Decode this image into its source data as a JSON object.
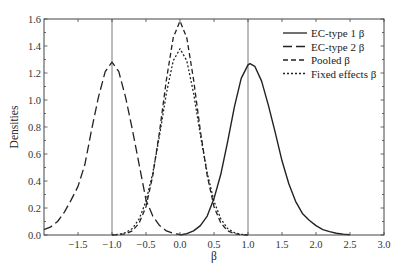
{
  "chart_data": {
    "type": "line",
    "title": "",
    "xlabel": "β",
    "ylabel": "Densities",
    "xlim": [
      -2.0,
      3.0
    ],
    "ylim": [
      0.0,
      1.6
    ],
    "grid": false,
    "legend_position": "upper right",
    "xticks": [
      -1.5,
      -1.0,
      -0.5,
      0.0,
      0.5,
      1.0,
      1.5,
      2.0,
      2.5,
      3.0
    ],
    "xtick_labels": [
      "−1.5",
      "−1.0",
      "−0.5",
      "0.0",
      "0.5",
      "1.0",
      "1.5",
      "2.0",
      "2.5",
      "3.0"
    ],
    "yticks": [
      0.0,
      0.2,
      0.4,
      0.6,
      0.8,
      1.0,
      1.2,
      1.4,
      1.6
    ],
    "ytick_labels": [
      "0.0",
      "0.2",
      "0.4",
      "0.6",
      "0.8",
      "1.0",
      "1.2",
      "1.4",
      "1.6"
    ],
    "vertical_lines": [
      -1.0,
      1.0
    ],
    "series": [
      {
        "name": "EC-type 1 β",
        "style": "solid",
        "x": [
          0.0,
          0.1,
          0.2,
          0.3,
          0.4,
          0.5,
          0.6,
          0.7,
          0.8,
          0.9,
          1.0,
          1.03,
          1.1,
          1.2,
          1.3,
          1.4,
          1.5,
          1.6,
          1.7,
          1.8,
          1.9,
          2.0,
          2.1,
          2.2,
          2.3,
          2.4,
          2.5
        ],
        "y": [
          0.0,
          0.01,
          0.03,
          0.07,
          0.14,
          0.27,
          0.45,
          0.69,
          0.95,
          1.16,
          1.26,
          1.27,
          1.25,
          1.14,
          0.96,
          0.76,
          0.55,
          0.38,
          0.25,
          0.16,
          0.11,
          0.07,
          0.04,
          0.025,
          0.013,
          0.006,
          0.002
        ]
      },
      {
        "name": "EC-type 2 β",
        "style": "long-dash",
        "x": [
          -2.0,
          -1.9,
          -1.8,
          -1.7,
          -1.6,
          -1.5,
          -1.4,
          -1.3,
          -1.2,
          -1.1,
          -1.0,
          -0.9,
          -0.8,
          -0.7,
          -0.6,
          -0.5,
          -0.4,
          -0.3,
          -0.2,
          -0.1,
          0.0
        ],
        "y": [
          0.04,
          0.06,
          0.1,
          0.17,
          0.26,
          0.36,
          0.52,
          0.78,
          1.02,
          1.21,
          1.28,
          1.21,
          1.02,
          0.78,
          0.52,
          0.26,
          0.14,
          0.07,
          0.03,
          0.012,
          0.004
        ]
      },
      {
        "name": "Pooled β",
        "style": "dashed",
        "x": [
          -1.0,
          -0.9,
          -0.8,
          -0.7,
          -0.6,
          -0.5,
          -0.4,
          -0.3,
          -0.2,
          -0.1,
          0.0,
          0.1,
          0.2,
          0.3,
          0.4,
          0.5,
          0.6,
          0.7,
          0.8,
          0.9,
          1.0
        ],
        "y": [
          0.0,
          0.002,
          0.009,
          0.031,
          0.089,
          0.21,
          0.44,
          0.77,
          1.15,
          1.46,
          1.585,
          1.46,
          1.15,
          0.77,
          0.44,
          0.21,
          0.089,
          0.031,
          0.009,
          0.002,
          0.0
        ]
      },
      {
        "name": "Fixed effects β",
        "style": "dotted",
        "x": [
          -1.0,
          -0.9,
          -0.8,
          -0.7,
          -0.6,
          -0.5,
          -0.4,
          -0.3,
          -0.2,
          -0.1,
          0.0,
          0.1,
          0.2,
          0.3,
          0.4,
          0.5,
          0.6,
          0.7,
          0.8,
          0.9,
          1.0
        ],
        "y": [
          0.001,
          0.005,
          0.017,
          0.048,
          0.12,
          0.25,
          0.46,
          0.74,
          1.05,
          1.29,
          1.38,
          1.29,
          1.05,
          0.74,
          0.46,
          0.25,
          0.12,
          0.048,
          0.017,
          0.005,
          0.001
        ]
      }
    ]
  },
  "legend": {
    "items": [
      {
        "label": "EC-type 1 β",
        "style": "solid"
      },
      {
        "label": "EC-type 2 β",
        "style": "long-dash"
      },
      {
        "label": "Pooled β",
        "style": "dashed"
      },
      {
        "label": "Fixed effects β",
        "style": "dotted"
      }
    ]
  },
  "colors": {
    "line": "#222222",
    "frame": "#444444",
    "vline": "#555555",
    "background": "#ffffff"
  }
}
